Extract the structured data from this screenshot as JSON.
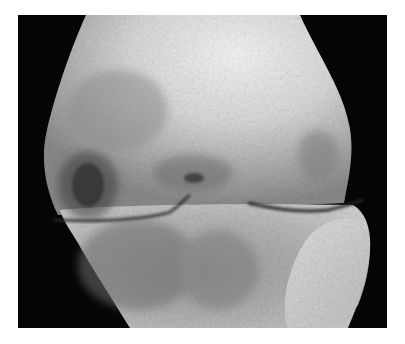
{
  "image": {
    "subject": "knee joint radiograph",
    "modality": "x-ray",
    "view": "anteroposterior",
    "colors": {
      "background": "#ffffff",
      "frame": "#050505",
      "bone_light": "#f2f2f2",
      "bone_mid": "#b8b8b8",
      "bone_dark": "#6a6a6a",
      "joint_line": "#2a2a2a"
    },
    "frame": {
      "x": 18,
      "y": 15,
      "width": 369,
      "height": 313
    },
    "features": [
      {
        "name": "femur",
        "position": "upper"
      },
      {
        "name": "tibia",
        "position": "lower"
      },
      {
        "name": "joint-space",
        "position": "middle"
      },
      {
        "name": "subchondral-cyst",
        "position": "left-middle"
      }
    ]
  }
}
